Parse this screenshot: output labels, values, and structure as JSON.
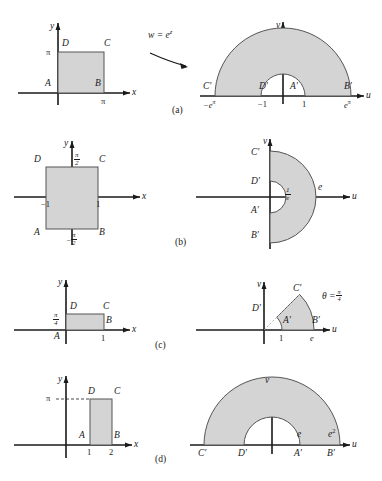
{
  "figure": {
    "mapping_label": "w = e",
    "mapping_exponent": "z",
    "colors": {
      "fill": "#d4d4d4",
      "stroke": "#555555",
      "axis": "#1a1a1a"
    }
  },
  "panels": [
    {
      "caption": "(a)",
      "left": {
        "axis_x": "x",
        "axis_y": "y",
        "vertices": [
          "A",
          "B",
          "C",
          "D"
        ],
        "ticks": [
          {
            "text": "π",
            "axis": "y"
          },
          {
            "text": "π",
            "axis": "x"
          }
        ]
      },
      "right": {
        "axis_u": "u",
        "axis_v": "v",
        "vertices": [
          "A′",
          "B′",
          "C′",
          "D′"
        ],
        "ticks": [
          {
            "base": "−e",
            "exp": "π"
          },
          {
            "base": "−1",
            "exp": ""
          },
          {
            "base": "1",
            "exp": ""
          },
          {
            "base": "e",
            "exp": "π"
          }
        ]
      }
    },
    {
      "caption": "(b)",
      "left": {
        "axis_x": "x",
        "axis_y": "y",
        "vertices": [
          "A",
          "B",
          "C",
          "D"
        ],
        "tick_top_num": "π",
        "tick_top_den": "2",
        "tick_bot_sign": "−",
        "tick_bot_num": "π",
        "tick_bot_den": "2",
        "tick_left": "−1",
        "tick_right": "1"
      },
      "right": {
        "axis_u": "u",
        "axis_v": "v",
        "vertices": [
          "A′",
          "B′",
          "C′",
          "D′"
        ],
        "inner_num": "1",
        "inner_den": "e",
        "outer_tick": "e"
      }
    },
    {
      "caption": "(c)",
      "left": {
        "axis_x": "x",
        "axis_y": "y",
        "vertices": [
          "A",
          "B",
          "C",
          "D"
        ],
        "tick_y_num": "π",
        "tick_y_den": "4",
        "tick_x": "1"
      },
      "right": {
        "axis_u": "u",
        "axis_v": "v",
        "vertices": [
          "A′",
          "B′",
          "C′",
          "D′"
        ],
        "theta_label": "θ =",
        "theta_num": "π",
        "theta_den": "4",
        "tick_inner": "1",
        "tick_outer": "e"
      }
    },
    {
      "caption": "(d)",
      "left": {
        "axis_x": "x",
        "axis_y": "y",
        "vertices": [
          "A",
          "B",
          "C",
          "D"
        ],
        "tick_y": "π",
        "tick_x1": "1",
        "tick_x2": "2"
      },
      "right": {
        "axis_u": "u",
        "axis_v": "v",
        "vertices": [
          "A′",
          "B′",
          "C′",
          "D′"
        ],
        "tick_inner": "e",
        "tick_outer_base": "e",
        "tick_outer_exp": "2"
      }
    }
  ]
}
